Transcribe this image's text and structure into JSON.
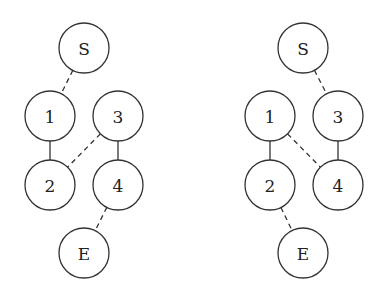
{
  "graphs": [
    {
      "id": "left",
      "nodes": [
        {
          "id": "S",
          "label": "S",
          "x": 84,
          "y": 48
        },
        {
          "id": "1",
          "label": "1",
          "x": 50,
          "y": 116
        },
        {
          "id": "3",
          "label": "3",
          "x": 118,
          "y": 116
        },
        {
          "id": "2",
          "label": "2",
          "x": 50,
          "y": 185
        },
        {
          "id": "4",
          "label": "4",
          "x": 118,
          "y": 185
        },
        {
          "id": "E",
          "label": "E",
          "x": 84,
          "y": 253
        }
      ],
      "edges": [
        {
          "from": "S",
          "to": "1",
          "style": "dashed"
        },
        {
          "from": "1",
          "to": "2",
          "style": "solid"
        },
        {
          "from": "3",
          "to": "2",
          "style": "dashed"
        },
        {
          "from": "3",
          "to": "4",
          "style": "solid"
        },
        {
          "from": "4",
          "to": "E",
          "style": "dashed"
        }
      ]
    },
    {
      "id": "right",
      "nodes": [
        {
          "id": "S",
          "label": "S",
          "x": 303,
          "y": 48
        },
        {
          "id": "1",
          "label": "1",
          "x": 270,
          "y": 116
        },
        {
          "id": "3",
          "label": "3",
          "x": 338,
          "y": 116
        },
        {
          "id": "2",
          "label": "2",
          "x": 270,
          "y": 185
        },
        {
          "id": "4",
          "label": "4",
          "x": 338,
          "y": 185
        },
        {
          "id": "E",
          "label": "E",
          "x": 303,
          "y": 253
        }
      ],
      "edges": [
        {
          "from": "S",
          "to": "3",
          "style": "dashed"
        },
        {
          "from": "1",
          "to": "2",
          "style": "solid"
        },
        {
          "from": "1",
          "to": "4",
          "style": "dashed"
        },
        {
          "from": "3",
          "to": "4",
          "style": "solid"
        },
        {
          "from": "2",
          "to": "E",
          "style": "dashed"
        }
      ]
    }
  ],
  "style": {
    "node_radius": 25,
    "stroke_color": "#333333",
    "background": "#ffffff"
  }
}
